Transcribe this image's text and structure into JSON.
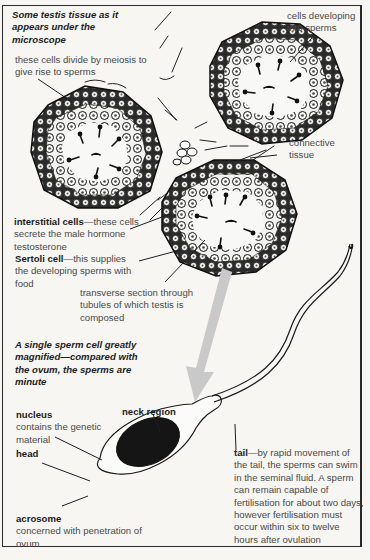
{
  "figure": {
    "section1_title": "Some testis tissue as it appears under the microscope",
    "section2_title": "A single sperm cell greatly magnified—compared with the ovum, the sperms are minute",
    "labels": {
      "meiosis": "these cells divide by meiosis to give rise to sperms",
      "developing": "cells developing into sperms",
      "connective": "connective tissue",
      "interstitial_term": "interstitial cells",
      "interstitial_desc": "—these cells secrete the male hormone testosterone",
      "sertoli_term": "Sertoli cell",
      "sertoli_desc": "—this supplies the developing sperms with food",
      "transverse": "transverse section through tubules of which testis is composed",
      "nucleus_term": "nucleus",
      "nucleus_desc": "contains the genetic material",
      "neck": "neck region",
      "head": "head",
      "acrosome_term": "acrosome",
      "acrosome_desc": "concerned with penetration of ovum",
      "tail_term": "tail",
      "tail_desc": "—by rapid movement of the tail, the sperms can swim in the seminal fluid. A sperm can remain capable of fertilisation for about two days, however fertilisation must occur within six to twelve hours after ovulation"
    },
    "colors": {
      "ink": "#1e1e1e",
      "arrow": "#c9c9c9",
      "nucleus_fill": "#151515",
      "paper": "#f7f6f3"
    },
    "icons": [
      "tubule-cross-section",
      "sperm-cell",
      "magnify-arrow"
    ]
  }
}
